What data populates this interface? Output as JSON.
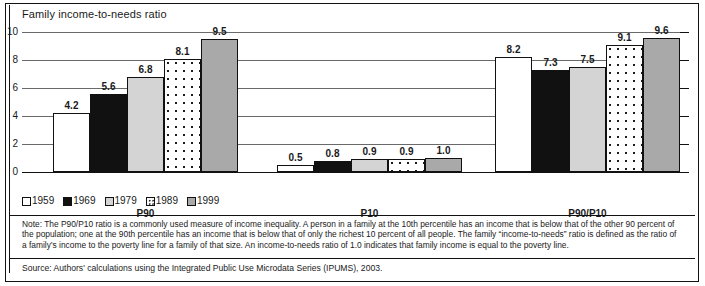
{
  "chart_data": {
    "type": "bar",
    "title": "Family income-to-needs ratio",
    "xlabel": "",
    "ylabel": "Family income-to-needs ratio",
    "ylim": [
      0,
      10
    ],
    "yticks": [
      "0",
      "2",
      "4",
      "6",
      "8",
      "10"
    ],
    "grid": true,
    "legend_position": "bottom-left",
    "categories": [
      "P90",
      "P10",
      "P90/P10"
    ],
    "series": [
      {
        "name": "1959",
        "values": [
          4.2,
          0.5,
          8.2
        ],
        "labels": [
          "4.2",
          "0.5",
          "8.2"
        ],
        "swatch": "#ffffff"
      },
      {
        "name": "1969",
        "values": [
          5.6,
          0.8,
          7.3
        ],
        "labels": [
          "5.6",
          "0.8",
          "7.3"
        ],
        "swatch": "#111111"
      },
      {
        "name": "1979",
        "values": [
          6.8,
          0.9,
          7.5
        ],
        "labels": [
          "6.8",
          "0.9",
          "7.5"
        ],
        "swatch": "#d4d4d4"
      },
      {
        "name": "1989",
        "values": [
          8.1,
          0.9,
          9.1
        ],
        "labels": [
          "8.1",
          "0.9",
          "9.1"
        ],
        "swatch": "dotted"
      },
      {
        "name": "1999",
        "values": [
          9.5,
          1.0,
          9.6
        ],
        "labels": [
          "9.5",
          "1.0",
          "9.6"
        ],
        "swatch": "#a9a9a9"
      }
    ]
  },
  "chart": {
    "title": "Family income-to-needs ratio",
    "y_axis": {
      "ticks": [
        "10",
        "8",
        "6",
        "4",
        "2",
        "0"
      ]
    },
    "group_labels": [
      "P90",
      "P10",
      "P90/P10"
    ],
    "legend": [
      {
        "label": "1959"
      },
      {
        "label": "1969"
      },
      {
        "label": "1979"
      },
      {
        "label": "1989"
      },
      {
        "label": "1999"
      }
    ],
    "bars": {
      "P90": [
        {
          "series": "1959",
          "label": "4.2",
          "value": 4.2
        },
        {
          "series": "1969",
          "label": "5.6",
          "value": 5.6
        },
        {
          "series": "1979",
          "label": "6.8",
          "value": 6.8
        },
        {
          "series": "1989",
          "label": "8.1",
          "value": 8.1
        },
        {
          "series": "1999",
          "label": "9.5",
          "value": 9.5
        }
      ],
      "P10": [
        {
          "series": "1959",
          "label": "0.5",
          "value": 0.5
        },
        {
          "series": "1969",
          "label": "0.8",
          "value": 0.8
        },
        {
          "series": "1979",
          "label": "0.9",
          "value": 0.9
        },
        {
          "series": "1989",
          "label": "0.9",
          "value": 0.9
        },
        {
          "series": "1999",
          "label": "1.0",
          "value": 1.0
        }
      ],
      "P90/P10": [
        {
          "series": "1959",
          "label": "8.2",
          "value": 8.2
        },
        {
          "series": "1969",
          "label": "7.3",
          "value": 7.3
        },
        {
          "series": "1979",
          "label": "7.5",
          "value": 7.5
        },
        {
          "series": "1989",
          "label": "9.1",
          "value": 9.1
        },
        {
          "series": "1999",
          "label": "9.6",
          "value": 9.6
        }
      ]
    }
  },
  "footer": {
    "note": "Note: The P90/P10 ratio is a commonly used measure of income inequality. A person in a family at the 10th percentile has an income that is below that of the other 90 percent of the population; one at the 90th percentile has an income that is below that of only the richest 10 percent of all people. The family “income-to-needs” ratio is defined as the ratio of a family’s income to the poverty line for a family of that size. An income-to-needs ratio of 1.0 indicates that family income is equal to the poverty line.",
    "source": "Source: Authors' calculations using the Integrated Public Use Microdata Series (IPUMS), 2003."
  }
}
